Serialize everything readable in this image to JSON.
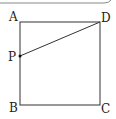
{
  "figure": {
    "type": "geometry-square",
    "vertices": {
      "A": {
        "label": "A",
        "x": 20,
        "y": 22
      },
      "D": {
        "label": "D",
        "x": 100,
        "y": 22
      },
      "B": {
        "label": "B",
        "x": 20,
        "y": 105
      },
      "C": {
        "label": "C",
        "x": 100,
        "y": 105
      },
      "P": {
        "label": "P",
        "x": 20,
        "y": 56
      }
    },
    "segments": [
      "AD",
      "DC",
      "CB",
      "BA",
      "PD"
    ],
    "colors": {
      "line": "#333333",
      "point": "#111111",
      "frame": "#888888"
    }
  }
}
